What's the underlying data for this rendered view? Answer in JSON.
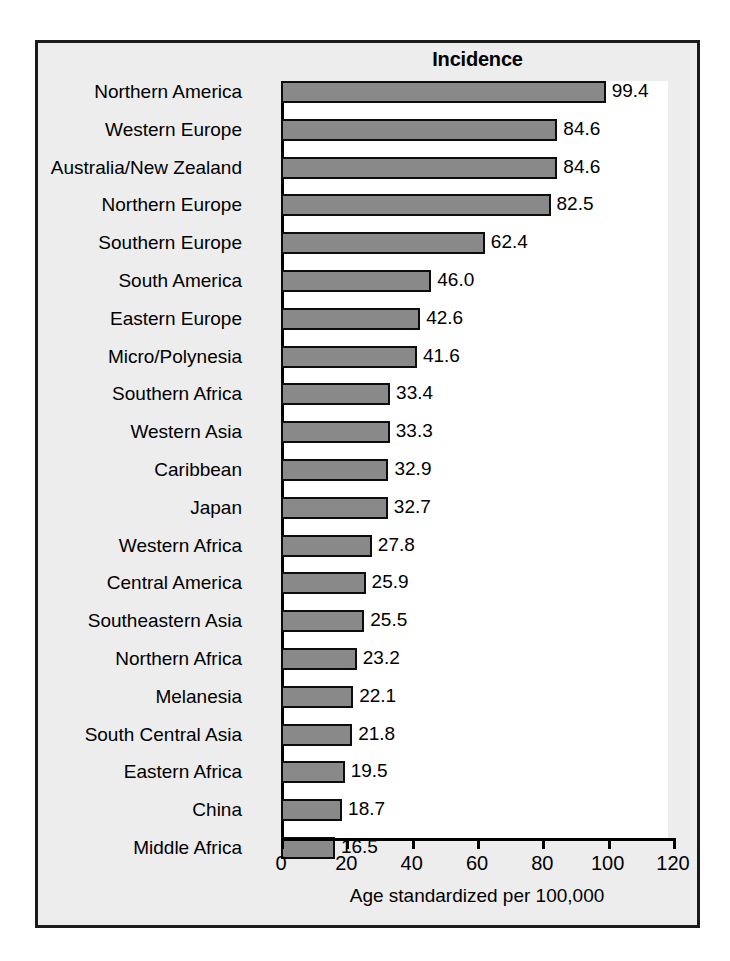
{
  "figure": {
    "background_color": "#ededed",
    "border_color": "#1a1a1a",
    "plot_background_color": "#ffffff"
  },
  "chart_data": {
    "type": "bar",
    "orientation": "horizontal",
    "title": "Incidence",
    "xlabel": "Age standardized per 100,000",
    "ylabel": "",
    "xlim": [
      0,
      120
    ],
    "xticks": [
      0,
      20,
      40,
      60,
      80,
      100,
      120
    ],
    "grid": false,
    "legend": null,
    "bar_color": "#898989",
    "bar_edge_color": "#0d0d0d",
    "data_labels": true,
    "categories": [
      "Northern America",
      "Western Europe",
      "Australia/New Zealand",
      "Northern Europe",
      "Southern Europe",
      "South America",
      "Eastern Europe",
      "Micro/Polynesia",
      "Southern Africa",
      "Western Asia",
      "Caribbean",
      "Japan",
      "Western Africa",
      "Central America",
      "Southeastern Asia",
      "Northern Africa",
      "Melanesia",
      "South Central Asia",
      "Eastern Africa",
      "China",
      "Middle Africa"
    ],
    "values": [
      99.4,
      84.6,
      84.6,
      82.5,
      62.4,
      46.0,
      42.6,
      41.6,
      33.4,
      33.3,
      32.9,
      32.7,
      27.8,
      25.9,
      25.5,
      23.2,
      22.1,
      21.8,
      19.5,
      18.7,
      16.5
    ],
    "value_labels": [
      "99.4",
      "84.6",
      "84.6",
      "82.5",
      "62.4",
      "46.0",
      "42.6",
      "41.6",
      "33.4",
      "33.3",
      "32.9",
      "32.7",
      "27.8",
      "25.9",
      "25.5",
      "23.2",
      "22.1",
      "21.8",
      "19.5",
      "18.7",
      "16.5"
    ],
    "xtick_labels": [
      "0",
      "20",
      "40",
      "60",
      "80",
      "100",
      "120"
    ]
  }
}
